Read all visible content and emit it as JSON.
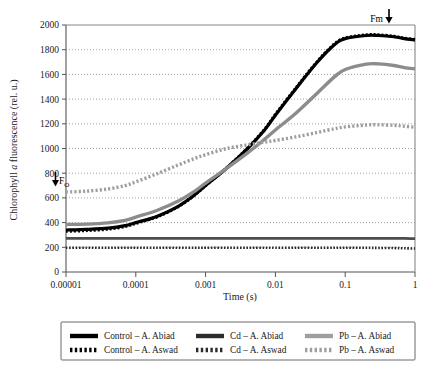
{
  "chart_data": {
    "type": "line",
    "title": "",
    "xlabel": "Time (s)",
    "ylabel": "Chlorophyll a fluorescence (rel. u.)",
    "ylabel_plain": "Chlorophyll",
    "ylabel_italic": "a",
    "ylabel_tail": "fluorescence (rel. u.)",
    "xscale": "log",
    "xlim": [
      1e-05,
      1
    ],
    "ylim": [
      0,
      2000
    ],
    "grid": true,
    "grid_style": "horizontal dotted",
    "xticks": [
      1e-05,
      0.0001,
      0.001,
      0.01,
      0.1,
      1
    ],
    "xtick_labels": [
      "0.00001",
      "0.0001",
      "0.001",
      "0.01",
      "0.1",
      "1"
    ],
    "yticks": [
      0,
      200,
      400,
      600,
      800,
      1000,
      1200,
      1400,
      1600,
      1800,
      2000
    ],
    "ytick_labels": [
      "0",
      "200",
      "400",
      "600",
      "800",
      "1000",
      "1200",
      "1400",
      "1600",
      "1800",
      "2000"
    ],
    "legend_position": "below plot, 3 columns x 2 rows",
    "annotations": [
      {
        "text": "Fm",
        "x": 0.25,
        "y": 2000,
        "arrow": "down",
        "arrow_side": "right"
      },
      {
        "text": "F",
        "sub": "O",
        "x": 1e-05,
        "y": 700,
        "arrow": "down",
        "arrow_side": "left"
      }
    ],
    "x": [
      1e-05,
      2e-05,
      4e-05,
      7e-05,
      0.0001,
      0.0002,
      0.0004,
      0.0007,
      0.001,
      0.002,
      0.004,
      0.007,
      0.01,
      0.02,
      0.04,
      0.07,
      0.1,
      0.2,
      0.3,
      0.5,
      0.7,
      1
    ],
    "series": [
      {
        "name": "Control – A. Abiad",
        "color": "#000000",
        "style": "solid",
        "width": 3.2,
        "values": [
          340,
          345,
          355,
          375,
          400,
          450,
          530,
          625,
          700,
          840,
          1000,
          1150,
          1270,
          1490,
          1700,
          1840,
          1890,
          1915,
          1915,
          1905,
          1890,
          1880
        ]
      },
      {
        "name": "Control – A. Aswad",
        "color": "#000000",
        "style": "dotted",
        "width": 3.2,
        "values": [
          330,
          336,
          347,
          368,
          394,
          446,
          528,
          624,
          700,
          842,
          1003,
          1155,
          1275,
          1495,
          1705,
          1845,
          1895,
          1920,
          1920,
          1908,
          1893,
          1882
        ]
      },
      {
        "name": "Cd – A. Abiad",
        "color": "#4d4d4d",
        "style": "solid",
        "width": 2.8,
        "values": [
          272,
          272,
          272,
          272,
          272,
          272,
          272,
          272,
          272,
          272,
          272,
          272,
          272,
          272,
          272,
          272,
          272,
          272,
          272,
          272,
          272,
          270
        ]
      },
      {
        "name": "Cd – A. Aswad",
        "color": "#2b2b2b",
        "style": "dotted",
        "width": 2.6,
        "values": [
          196,
          196,
          196,
          196,
          196,
          196,
          196,
          196,
          196,
          196,
          196,
          196,
          196,
          196,
          196,
          196,
          196,
          196,
          195,
          194,
          192,
          190
        ]
      },
      {
        "name": "Pb – A. Abiad",
        "color": "#8c8c8c",
        "style": "solid",
        "width": 3.4,
        "values": [
          385,
          388,
          398,
          418,
          445,
          498,
          572,
          655,
          720,
          840,
          965,
          1075,
          1150,
          1290,
          1450,
          1580,
          1640,
          1683,
          1685,
          1672,
          1655,
          1645
        ]
      },
      {
        "name": "Pb – A. Aswad",
        "color": "#9e9e9e",
        "style": "dotted",
        "width": 3.4,
        "values": [
          648,
          655,
          672,
          700,
          730,
          795,
          865,
          920,
          950,
          1000,
          1030,
          1052,
          1065,
          1095,
          1130,
          1160,
          1175,
          1190,
          1192,
          1188,
          1180,
          1172
        ]
      }
    ]
  },
  "legend": {
    "rows": [
      [
        {
          "label": "Control – A. Abiad",
          "color": "#000000",
          "style": "solid"
        },
        {
          "label": "Cd – A. Abiad",
          "color": "#2b2b2b",
          "style": "solid"
        },
        {
          "label": "Pb – A. Abiad",
          "color": "#9e9e9e",
          "style": "solid"
        }
      ],
      [
        {
          "label": "Control – A. Aswad",
          "color": "#000000",
          "style": "dotted"
        },
        {
          "label": "Cd – A. Aswad",
          "color": "#2b2b2b",
          "style": "dotted"
        },
        {
          "label": "Pb – A. Aswad",
          "color": "#9e9e9e",
          "style": "dotted"
        }
      ]
    ]
  }
}
